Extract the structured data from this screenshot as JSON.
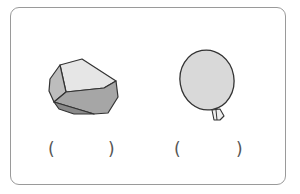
{
  "items": [
    {
      "name": "rock",
      "answer_open": "(",
      "answer_close": ")"
    },
    {
      "name": "balloon",
      "answer_open": "(",
      "answer_close": ")"
    }
  ],
  "colors": {
    "border": "#9a9a9a",
    "outline": "#333333",
    "light_fill": "#e6e6e6",
    "mid_fill": "#b3b3b3",
    "dark_fill": "#8f8f8f",
    "balloon_fill": "#d9d9d9"
  }
}
